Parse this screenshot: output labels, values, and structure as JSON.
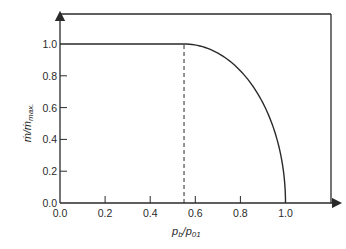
{
  "chart_data": {
    "type": "line",
    "title": "",
    "xlabel": "p_b/p_01",
    "ylabel": "ṁ/ṁ_max.",
    "xlim": [
      0.0,
      1.0
    ],
    "ylim": [
      0.0,
      1.0
    ],
    "x_ticks": [
      "0.0",
      "0.2",
      "0.4",
      "0.6",
      "0.8",
      "1.0"
    ],
    "y_ticks": [
      "0.0",
      "0.2",
      "0.4",
      "0.6",
      "0.8",
      "1.0"
    ],
    "grid": false,
    "legend": null,
    "series": [
      {
        "name": "mass flow ratio",
        "style": "solid",
        "x": [
          0.0,
          0.55,
          0.6,
          0.65,
          0.7,
          0.75,
          0.8,
          0.85,
          0.9,
          0.95,
          0.98,
          1.0
        ],
        "y": [
          1.0,
          1.0,
          0.994,
          0.975,
          0.94,
          0.89,
          0.82,
          0.72,
          0.58,
          0.39,
          0.21,
          0.0
        ]
      }
    ],
    "annotations": [
      {
        "type": "vertical-dashed-line",
        "x": 0.55,
        "y_from": 0.0,
        "y_to": 1.0,
        "label": "critical pressure ratio"
      }
    ]
  },
  "axes": {
    "x_label_main": "p",
    "x_label_sub_b": "b",
    "x_label_slash": "/p",
    "x_label_sub_01": "01",
    "y_label_main": "ṁ/ṁ",
    "y_label_sub": "max."
  }
}
